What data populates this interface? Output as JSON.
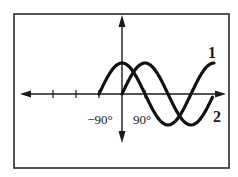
{
  "frame": {
    "x": 14,
    "y": 14,
    "width": 215,
    "height": 154,
    "color": "#2a2a2a"
  },
  "axes": {
    "origin_x": 122,
    "origin_y": 94,
    "x_left": 20,
    "x_right": 226,
    "y_top": 15,
    "y_bottom": 143,
    "px_per_90deg": 23,
    "amplitude_px": 31,
    "color": "#1a1a1a"
  },
  "labels": {
    "neg90": "−90°",
    "pos90": "90°",
    "curve1": "1",
    "curve2": "2"
  },
  "chart_data": {
    "type": "line",
    "title": "",
    "xlabel": "angle (degrees)",
    "ylabel": "",
    "tick_labels": [
      "−90°",
      "90°"
    ],
    "ticks_deg": [
      -270,
      -180,
      -90,
      90
    ],
    "grid": false,
    "series": [
      {
        "name": "1",
        "function": "cos",
        "x_range_deg": [
          -90,
          360
        ],
        "amplitude": 1
      },
      {
        "name": "2",
        "function": "sin",
        "x_range_deg": [
          0,
          355
        ],
        "amplitude": 1
      }
    ]
  }
}
